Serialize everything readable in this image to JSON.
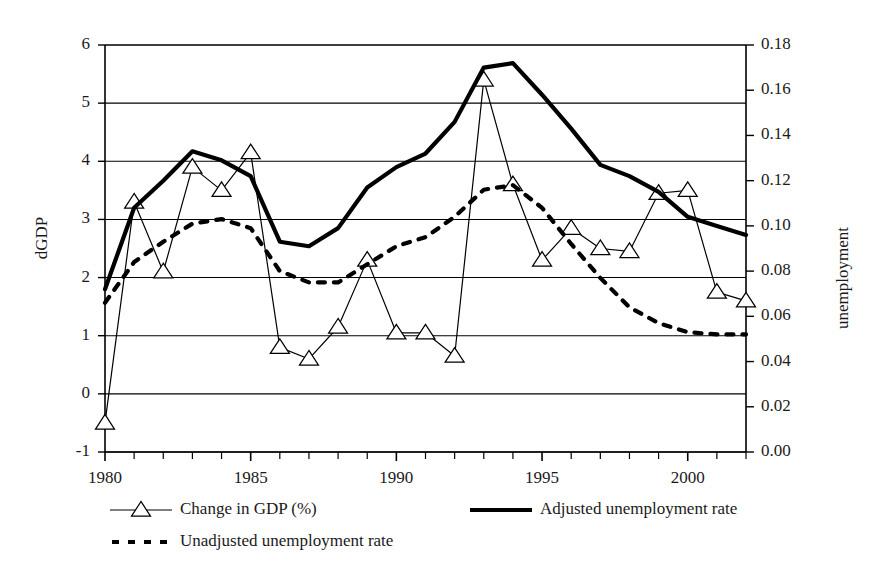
{
  "chart_data": {
    "type": "line",
    "title": "",
    "xlabel": "",
    "ylabel": "dGDP",
    "y2label": "unemployment",
    "x": [
      1980,
      1981,
      1982,
      1983,
      1984,
      1985,
      1986,
      1987,
      1988,
      1989,
      1990,
      1991,
      1992,
      1993,
      1994,
      1995,
      1996,
      1997,
      1998,
      1999,
      2000,
      2001,
      2002
    ],
    "xlim": [
      1980,
      2002
    ],
    "xticks": [
      1980,
      1985,
      1990,
      1995,
      2000
    ],
    "xtick_labels": [
      "1980",
      "1985",
      "1990",
      "1995",
      "2000"
    ],
    "xminor_every": 1,
    "ylim": [
      -1,
      6
    ],
    "yticks": [
      -1,
      0,
      1,
      2,
      3,
      4,
      5,
      6
    ],
    "ytick_labels": [
      "-1",
      "0",
      "1",
      "2",
      "3",
      "4",
      "5",
      "6"
    ],
    "y2lim": [
      0.0,
      0.18
    ],
    "y2ticks": [
      0.0,
      0.02,
      0.04,
      0.06,
      0.08,
      0.1,
      0.12,
      0.14,
      0.16,
      0.18
    ],
    "y2tick_labels": [
      "0.00",
      "0.02",
      "0.04",
      "0.06",
      "0.08",
      "0.10",
      "0.12",
      "0.14",
      "0.16",
      "0.18"
    ],
    "grid": true,
    "grid_axis": "y-left",
    "legend_position": "bottom",
    "series": [
      {
        "name": "Change in GDP (%)",
        "axis": "left",
        "marker": "triangle-open",
        "style": "solid-thin",
        "color": "#000000",
        "values": [
          -0.5,
          3.3,
          2.1,
          3.9,
          3.5,
          4.15,
          0.8,
          0.6,
          1.15,
          2.3,
          1.05,
          1.05,
          0.65,
          5.4,
          3.6,
          2.3,
          2.85,
          2.5,
          2.45,
          3.45,
          3.5,
          1.75,
          1.6
        ]
      },
      {
        "name": "Adjusted unemployment rate",
        "axis": "right",
        "marker": "none",
        "style": "solid-thick",
        "color": "#000000",
        "values": [
          0.072,
          0.108,
          0.12,
          0.133,
          0.129,
          0.122,
          0.093,
          0.091,
          0.099,
          0.117,
          0.126,
          0.132,
          0.146,
          0.17,
          0.172,
          0.158,
          0.143,
          0.127,
          0.122,
          0.115,
          0.104,
          0.1,
          0.096
        ]
      },
      {
        "name": "Unadjusted unemployment rate",
        "axis": "right",
        "marker": "none",
        "style": "dashed",
        "color": "#000000",
        "values": [
          0.066,
          0.084,
          0.093,
          0.101,
          0.103,
          0.099,
          0.08,
          0.075,
          0.075,
          0.083,
          0.091,
          0.095,
          0.104,
          0.116,
          0.118,
          0.108,
          0.092,
          0.077,
          0.064,
          0.057,
          0.053,
          0.052,
          0.052
        ]
      }
    ]
  },
  "legend": {
    "items": [
      {
        "label": "Change in GDP (%)",
        "marker": "triangle-open",
        "style": "solid-thin"
      },
      {
        "label": "Adjusted unemployment rate",
        "marker": "none",
        "style": "solid-thick"
      },
      {
        "label": "Unadjusted unemployment rate",
        "marker": "none",
        "style": "dashed"
      }
    ]
  },
  "colors": {
    "line": "#000000",
    "grid": "#000000",
    "axis": "#000000",
    "background": "#ffffff"
  }
}
